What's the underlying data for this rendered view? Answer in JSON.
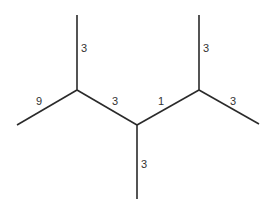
{
  "diagram": {
    "type": "skeletal-tree",
    "line_color": "#2a2a2a",
    "label_color": "#333333",
    "nodes": [
      {
        "id": "A_top",
        "x": 77,
        "y": 15
      },
      {
        "id": "A",
        "x": 77,
        "y": 90
      },
      {
        "id": "L_end",
        "x": 17,
        "y": 125
      },
      {
        "id": "C",
        "x": 137,
        "y": 125
      },
      {
        "id": "C_bottom",
        "x": 137,
        "y": 199
      },
      {
        "id": "B",
        "x": 199,
        "y": 90
      },
      {
        "id": "B_top",
        "x": 199,
        "y": 15
      },
      {
        "id": "R_end",
        "x": 259,
        "y": 124
      }
    ],
    "edges": [
      {
        "from": "A_top",
        "to": "A",
        "label": "3",
        "label_x": 81,
        "label_y": 52
      },
      {
        "from": "L_end",
        "to": "A",
        "label": "9",
        "label_x": 36,
        "label_y": 105
      },
      {
        "from": "A",
        "to": "C",
        "label": "3",
        "label_x": 112,
        "label_y": 105
      },
      {
        "from": "C",
        "to": "B",
        "label": "1",
        "label_x": 158,
        "label_y": 105
      },
      {
        "from": "B_top",
        "to": "B",
        "label": "3",
        "label_x": 203,
        "label_y": 52
      },
      {
        "from": "B",
        "to": "R_end",
        "label": "3",
        "label_x": 230,
        "label_y": 105
      },
      {
        "from": "C",
        "to": "C_bottom",
        "label": "3",
        "label_x": 141,
        "label_y": 168
      }
    ]
  }
}
